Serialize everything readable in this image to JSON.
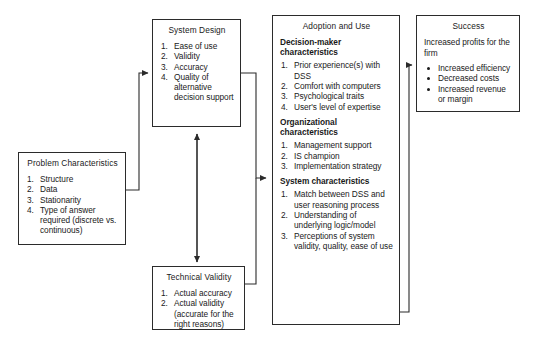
{
  "diagram": {
    "line_color": "#2b2b2b",
    "background": "#ffffff"
  },
  "boxes": {
    "problem": {
      "title": "Problem Characteristics",
      "items": [
        "Structure",
        "Data",
        "Stationarity",
        "Type of answer required (discrete vs. continuous)"
      ]
    },
    "system_design": {
      "title": "System Design",
      "items": [
        "Ease of use",
        "Validity",
        "Accuracy",
        "Quality of alternative decision support"
      ]
    },
    "technical_validity": {
      "title": "Technical Validity",
      "items": [
        "Actual accuracy",
        "Actual validity (accurate for the right reasons)"
      ]
    },
    "adoption": {
      "title": "Adoption and Use",
      "sections": [
        {
          "heading": "Decision-maker characteristics",
          "items": [
            "Prior experience(s) with DSS",
            "Comfort with computers",
            "Psychological traits",
            "User's level of expertise"
          ]
        },
        {
          "heading": "Organizational characteristics",
          "items": [
            "Management support",
            "IS champion",
            "Implementation strategy"
          ]
        },
        {
          "heading": "System characteristics",
          "items": [
            "Match between DSS and user reasoning process",
            "Understanding of underlying logic/model",
            "Perceptions of system validity, quality, ease of use"
          ]
        }
      ]
    },
    "success": {
      "title": "Success",
      "lead": "Increased profits for the firm",
      "bullets": [
        "Increased efficiency",
        "Decreased costs",
        "Increased revenue or margin"
      ]
    }
  }
}
